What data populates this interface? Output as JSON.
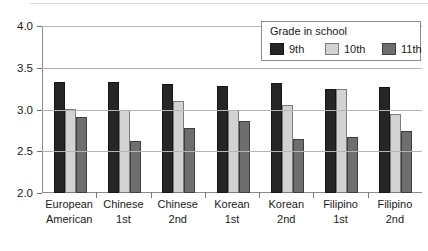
{
  "chart_data": {
    "type": "bar",
    "title": "",
    "xlabel": "",
    "ylabel": "",
    "ylim": [
      2.0,
      4.0
    ],
    "yticks": [
      "2.0",
      "2.5",
      "3.0",
      "3.5",
      "4.0"
    ],
    "ytick_values": [
      2.0,
      2.5,
      3.0,
      3.5,
      4.0
    ],
    "grid": true,
    "legend_position": "top-right",
    "legend_title": "Grade in school",
    "categories": [
      [
        "European",
        "American"
      ],
      [
        "Chinese",
        "1st"
      ],
      [
        "Chinese",
        "2nd"
      ],
      [
        "Korean",
        "1st"
      ],
      [
        "Korean",
        "2nd"
      ],
      [
        "Filipino",
        "1st"
      ],
      [
        "Filipino",
        "2nd"
      ]
    ],
    "category_labels": [
      "European American",
      "Chinese 1st",
      "Chinese 2nd",
      "Korean 1st",
      "Korean 2nd",
      "Filipino 1st",
      "Filipino 2nd"
    ],
    "series": [
      {
        "name": "9th",
        "color": "#262626",
        "values": [
          3.33,
          3.33,
          3.3,
          3.28,
          3.32,
          3.24,
          3.27
        ]
      },
      {
        "name": "10th",
        "color": "#d2d2d2",
        "values": [
          3.01,
          3.0,
          3.1,
          3.0,
          3.06,
          3.24,
          2.95
        ]
      },
      {
        "name": "11th",
        "color": "#6e6e6e",
        "values": [
          2.91,
          2.62,
          2.78,
          2.86,
          2.65,
          2.67,
          2.74
        ]
      }
    ]
  },
  "legend": {
    "title": "Grade in school",
    "items": [
      {
        "label": "9th"
      },
      {
        "label": "10th"
      },
      {
        "label": "11th"
      }
    ]
  },
  "axis": {
    "y": {
      "ticks": [
        {
          "label": "4.0"
        },
        {
          "label": "3.5"
        },
        {
          "label": "3.0"
        },
        {
          "label": "2.5"
        },
        {
          "label": "2.0"
        }
      ]
    }
  }
}
